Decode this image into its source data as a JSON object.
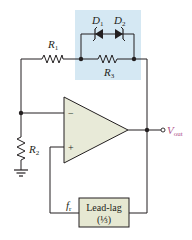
{
  "diagram": {
    "components": {
      "r1": {
        "label": "R",
        "subscript": "1"
      },
      "r2": {
        "label": "R",
        "subscript": "2"
      },
      "r3": {
        "label": "R",
        "subscript": "3"
      },
      "d1": {
        "label": "D",
        "subscript": "1"
      },
      "d2": {
        "label": "D",
        "subscript": "2"
      },
      "opamp": {
        "inverting": "−",
        "noninverting": "+"
      },
      "lead_lag": {
        "line1": "Lead-lag",
        "line2": "(⅓)"
      },
      "fr_label": {
        "label": "f",
        "subscript": "r"
      },
      "vout": {
        "label": "V",
        "subscript": "out"
      }
    },
    "colors": {
      "highlight_box": "#d5e8f3",
      "opamp_fill": "#e8ead8",
      "leadlag_fill": "#e6e8d2",
      "wire": "#231f20",
      "vout_label": "#b0548a"
    }
  }
}
